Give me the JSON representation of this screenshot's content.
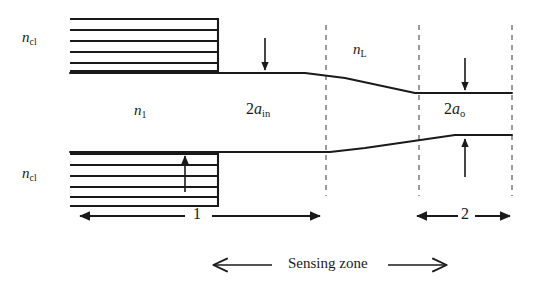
{
  "figure": {
    "kind": "optical-fiber-taper-sensor-schematic",
    "background_color": "#ffffff",
    "line_color": "#1a1a1a",
    "dashed_color": "#808080"
  },
  "labels": {
    "cladding_top": {
      "symbol": "n",
      "sub": "cl",
      "text": "ncl"
    },
    "cladding_bottom": {
      "symbol": "n",
      "sub": "cl",
      "text": "ncl"
    },
    "core_index": {
      "symbol": "n",
      "sub": "1",
      "text": "n1"
    },
    "liquid_index": {
      "symbol": "n",
      "sub": "L",
      "text": "nL"
    },
    "diameter_in": {
      "prefix": "2",
      "symbol": "a",
      "sub": "in",
      "text": "2ain"
    },
    "diameter_out": {
      "prefix": "2",
      "symbol": "a",
      "sub": "o",
      "text": "2ao"
    },
    "region_one": "1",
    "region_two": "2",
    "sensing_zone": "Sensing zone"
  },
  "cladding_blocks": {
    "hatch_line_count": 6,
    "top": {
      "x": 70,
      "y": 18,
      "width": 148,
      "height": 55
    },
    "bottom": {
      "x": 70,
      "y": 152,
      "width": 148,
      "height": 55
    }
  },
  "waveguide": {
    "upper_profile": "M70,73 L305,73 L345,78 L415,93 L512,93",
    "lower_profile": "M70,152 L330,152 L365,148 L455,135 L512,135"
  },
  "dashed_verticals": [
    {
      "x": 326,
      "y1": 25,
      "y2": 196
    },
    {
      "x": 419,
      "y1": 25,
      "y2": 196
    },
    {
      "x": 512,
      "y1": 25,
      "y2": 196
    }
  ],
  "arrows": {
    "diameter_in_down": {
      "x": 265,
      "y1": 40,
      "y2": 73
    },
    "diameter_in_up": {
      "x": 185,
      "y1": 190,
      "y2": 152
    },
    "diameter_out_down": {
      "x": 465,
      "y1": 60,
      "y2": 93
    },
    "diameter_out_up": {
      "x": 465,
      "y1": 175,
      "y2": 135
    }
  },
  "span_arrows": {
    "region_one": {
      "x1": 78,
      "x2": 322,
      "y": 216,
      "label_x": 198
    },
    "region_two": {
      "x1": 415,
      "x2": 512,
      "y": 216,
      "label_x": 466
    },
    "sensing_left": {
      "x1": 272,
      "x2": 212,
      "y": 265
    },
    "sensing_right": {
      "x1": 388,
      "x2": 448,
      "y": 265
    }
  }
}
